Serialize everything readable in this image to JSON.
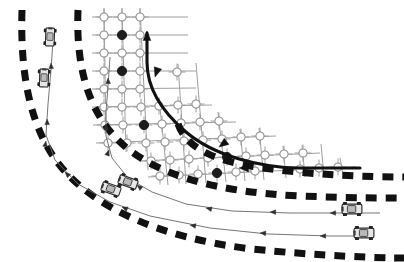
{
  "figure": {
    "title": "Curved road scenario with occupancy grid and vehicle trajectories",
    "background_color": "#ffffff",
    "width": 404,
    "height": 262
  },
  "palette": {
    "lane_marking": "#111111",
    "grid_line": "#9a9a9a",
    "grid_node_stroke": "#8c8c8c",
    "grid_node_fill_empty": "#ffffff",
    "grid_node_fill_occupied": "#111111",
    "trajectory_line": "#6f6f6f",
    "reference_path": "#111111",
    "vehicle_body": "#e8e8e8",
    "vehicle_outline": "#2b2b2b"
  },
  "lane_markings": {
    "name": "dashed-lane-boundaries",
    "dash_pattern": "11 9",
    "stroke_width": 7,
    "arcs": [
      {
        "id": "outer-lane-boundary",
        "path": "M 22 10 C 20 74, 30 130, 62 168 C 96 208, 160 238, 252 249 C 320 256, 380 258, 404 258"
      },
      {
        "id": "middle-lane-boundary",
        "path": "M 78 10 C 76 62, 86 108, 118 140 C 152 174, 214 192, 300 196 C 350 198, 386 198, 404 198"
      },
      {
        "id": "inner-lane-boundary",
        "path": "M 178 124 C 186 146, 210 160, 256 167 C 310 175, 368 177, 404 177"
      }
    ]
  },
  "grid": {
    "name": "occupancy-grid",
    "description": "Curvilinear occupancy grid overlaid on the inner lane; filled nodes mark occupied cells.",
    "node_radius": 4.1,
    "cross_half_length": 8.5,
    "columns": 9,
    "rows": 9,
    "occupied_count": 6,
    "nodes": [
      {
        "x": 104,
        "y": 17,
        "occupied": false
      },
      {
        "x": 122,
        "y": 17,
        "occupied": false
      },
      {
        "x": 140,
        "y": 17,
        "occupied": false
      },
      {
        "x": 104,
        "y": 35,
        "occupied": false
      },
      {
        "x": 122,
        "y": 35,
        "occupied": true
      },
      {
        "x": 140,
        "y": 35,
        "occupied": false
      },
      {
        "x": 104,
        "y": 53,
        "occupied": false
      },
      {
        "x": 122,
        "y": 53,
        "occupied": false
      },
      {
        "x": 140,
        "y": 53,
        "occupied": false
      },
      {
        "x": 104,
        "y": 71,
        "occupied": false
      },
      {
        "x": 122,
        "y": 71,
        "occupied": true
      },
      {
        "x": 140,
        "y": 71,
        "occupied": false
      },
      {
        "x": 104,
        "y": 89,
        "occupied": false
      },
      {
        "x": 122,
        "y": 89,
        "occupied": false
      },
      {
        "x": 140,
        "y": 89,
        "occupied": false
      },
      {
        "x": 177,
        "y": 72,
        "occupied": false
      },
      {
        "x": 104,
        "y": 107,
        "occupied": false
      },
      {
        "x": 122,
        "y": 107,
        "occupied": false
      },
      {
        "x": 141,
        "y": 107,
        "occupied": false
      },
      {
        "x": 159,
        "y": 106,
        "occupied": false
      },
      {
        "x": 178,
        "y": 105,
        "occupied": false
      },
      {
        "x": 196,
        "y": 104,
        "occupied": false
      },
      {
        "x": 105,
        "y": 125,
        "occupied": false
      },
      {
        "x": 123,
        "y": 125,
        "occupied": false
      },
      {
        "x": 144,
        "y": 125,
        "occupied": true
      },
      {
        "x": 162,
        "y": 124,
        "occupied": false
      },
      {
        "x": 181,
        "y": 123,
        "occupied": false
      },
      {
        "x": 200,
        "y": 122,
        "occupied": false
      },
      {
        "x": 219,
        "y": 121,
        "occupied": false
      },
      {
        "x": 108,
        "y": 143,
        "occupied": false
      },
      {
        "x": 127,
        "y": 143,
        "occupied": false
      },
      {
        "x": 146,
        "y": 143,
        "occupied": false
      },
      {
        "x": 165,
        "y": 142,
        "occupied": false
      },
      {
        "x": 184,
        "y": 141,
        "occupied": false
      },
      {
        "x": 203,
        "y": 140,
        "occupied": false
      },
      {
        "x": 222,
        "y": 139,
        "occupied": false
      },
      {
        "x": 241,
        "y": 137,
        "occupied": false
      },
      {
        "x": 260,
        "y": 136,
        "occupied": false
      },
      {
        "x": 151,
        "y": 161,
        "occupied": false
      },
      {
        "x": 170,
        "y": 160,
        "occupied": false
      },
      {
        "x": 189,
        "y": 159,
        "occupied": false
      },
      {
        "x": 208,
        "y": 158,
        "occupied": false
      },
      {
        "x": 227,
        "y": 157,
        "occupied": true
      },
      {
        "x": 246,
        "y": 156,
        "occupied": false
      },
      {
        "x": 265,
        "y": 155,
        "occupied": false
      },
      {
        "x": 284,
        "y": 154,
        "occupied": false
      },
      {
        "x": 303,
        "y": 153,
        "occupied": false
      },
      {
        "x": 160,
        "y": 176,
        "occupied": false
      },
      {
        "x": 179,
        "y": 175,
        "occupied": false
      },
      {
        "x": 198,
        "y": 174,
        "occupied": false
      },
      {
        "x": 217,
        "y": 173,
        "occupied": true
      },
      {
        "x": 236,
        "y": 172,
        "occupied": false
      },
      {
        "x": 255,
        "y": 171,
        "occupied": false
      },
      {
        "x": 300,
        "y": 169,
        "occupied": false
      },
      {
        "x": 319,
        "y": 168,
        "occupied": false
      },
      {
        "x": 338,
        "y": 167,
        "occupied": false
      }
    ],
    "horizontal_lines": [
      {
        "path": "M 92 17 L 188 17"
      },
      {
        "path": "M 92 35 L 188 35"
      },
      {
        "path": "M 92 53 L 188 53"
      },
      {
        "path": "M 92 71 L 196 71"
      },
      {
        "path": "M 92 89 L 196 88"
      },
      {
        "path": "M 92 107 L 212 105"
      },
      {
        "path": "M 93 125 L 236 122"
      },
      {
        "path": "M 96 143 L 276 136"
      },
      {
        "path": "M 139 161 L 320 153"
      },
      {
        "path": "M 148 177 L 356 167"
      }
    ],
    "vertical_lines": [
      {
        "path": "M 104 8 L 106 134"
      },
      {
        "path": "M 122 8 L 126 152"
      },
      {
        "path": "M 140 8 L 148 170"
      },
      {
        "path": "M 159 98 L 168 185"
      },
      {
        "path": "M 178 64 L 186 184"
      },
      {
        "path": "M 196 63 L 206 183"
      },
      {
        "path": "M 218 112 L 226 182"
      },
      {
        "path": "M 240 129 L 245 181"
      },
      {
        "path": "M 259 128 L 264 180"
      },
      {
        "path": "M 283 146 L 286 178"
      },
      {
        "path": "M 302 145 L 305 177"
      },
      {
        "path": "M 321 144 L 324 176"
      },
      {
        "path": "M 340 158 L 343 175"
      }
    ]
  },
  "reference_path": {
    "name": "ego-reference-path",
    "label": "Reference path of ego vehicle",
    "stroke_width": 3.1,
    "path": "M 147 33 L 147 62 C 147 86, 160 110, 186 132 C 214 156, 262 168, 300 168 L 360 168",
    "arrowheads": [
      {
        "id": "ref-arrow-head-top",
        "x": 147,
        "y": 31,
        "angle": -90
      },
      {
        "id": "ref-arrow-mid-upper",
        "x": 155,
        "y": 77,
        "angle": 108
      },
      {
        "id": "ref-arrow-mid-lower",
        "x": 219,
        "y": 147,
        "angle": 143
      },
      {
        "id": "ref-arrow-tail",
        "x": 239,
        "y": 168,
        "angle": 180
      }
    ]
  },
  "trajectories": [
    {
      "id": "trajectory-lane-1",
      "label": "Lane 1 vehicle trajectory",
      "path": "M 53 40 L 51 70 L 48 104 L 46 135 L 55 160 L 78 184 L 110 202 L 150 216 L 210 228 L 268 234 L 330 236 L 372 236",
      "arrowheads": [
        {
          "x": 51,
          "y": 63,
          "angle": -92
        },
        {
          "x": 47,
          "y": 119,
          "angle": -92
        },
        {
          "x": 46,
          "y": 141,
          "angle": -80
        },
        {
          "x": 65,
          "y": 172,
          "angle": -135
        },
        {
          "x": 122,
          "y": 207,
          "angle": -157
        },
        {
          "x": 190,
          "y": 225,
          "angle": -170
        },
        {
          "x": 260,
          "y": 233,
          "angle": -177
        },
        {
          "x": 320,
          "y": 236,
          "angle": 180
        }
      ]
    },
    {
      "id": "trajectory-lane-2",
      "label": "Lane 2 vehicle trajectory",
      "path": "M 110 57 L 108 86 L 106 112 L 106 136 L 112 158 L 128 178 L 152 192 L 186 204 L 232 211 L 290 213 L 340 213 L 380 213",
      "arrowheads": [
        {
          "x": 108,
          "y": 78,
          "angle": -92
        },
        {
          "x": 106,
          "y": 124,
          "angle": -90
        },
        {
          "x": 109,
          "y": 150,
          "angle": -70
        },
        {
          "x": 137,
          "y": 185,
          "angle": -140
        },
        {
          "x": 206,
          "y": 208,
          "angle": -168
        },
        {
          "x": 270,
          "y": 212,
          "angle": -178
        },
        {
          "x": 330,
          "y": 213,
          "angle": 180
        }
      ]
    }
  ],
  "vehicles": [
    {
      "id": "vehicle-lane1-upper",
      "x": 50,
      "y": 37,
      "rotation": -88,
      "scale": 1.0,
      "label": "Vehicle A"
    },
    {
      "id": "vehicle-lane2-upper",
      "x": 44,
      "y": 78,
      "rotation": -88,
      "scale": 1.0,
      "label": "Vehicle B"
    },
    {
      "id": "vehicle-mid-left",
      "x": 111,
      "y": 189,
      "rotation": -161,
      "scale": 1.05,
      "label": "Vehicle C"
    },
    {
      "id": "vehicle-mid-right",
      "x": 128,
      "y": 182,
      "rotation": -160,
      "scale": 1.05,
      "label": "Vehicle D"
    },
    {
      "id": "vehicle-lower-right-1",
      "x": 352,
      "y": 209,
      "rotation": 180,
      "scale": 1.1,
      "label": "Vehicle E"
    },
    {
      "id": "vehicle-lower-right-2",
      "x": 364,
      "y": 233,
      "rotation": 180,
      "scale": 1.1,
      "label": "Vehicle F"
    }
  ]
}
